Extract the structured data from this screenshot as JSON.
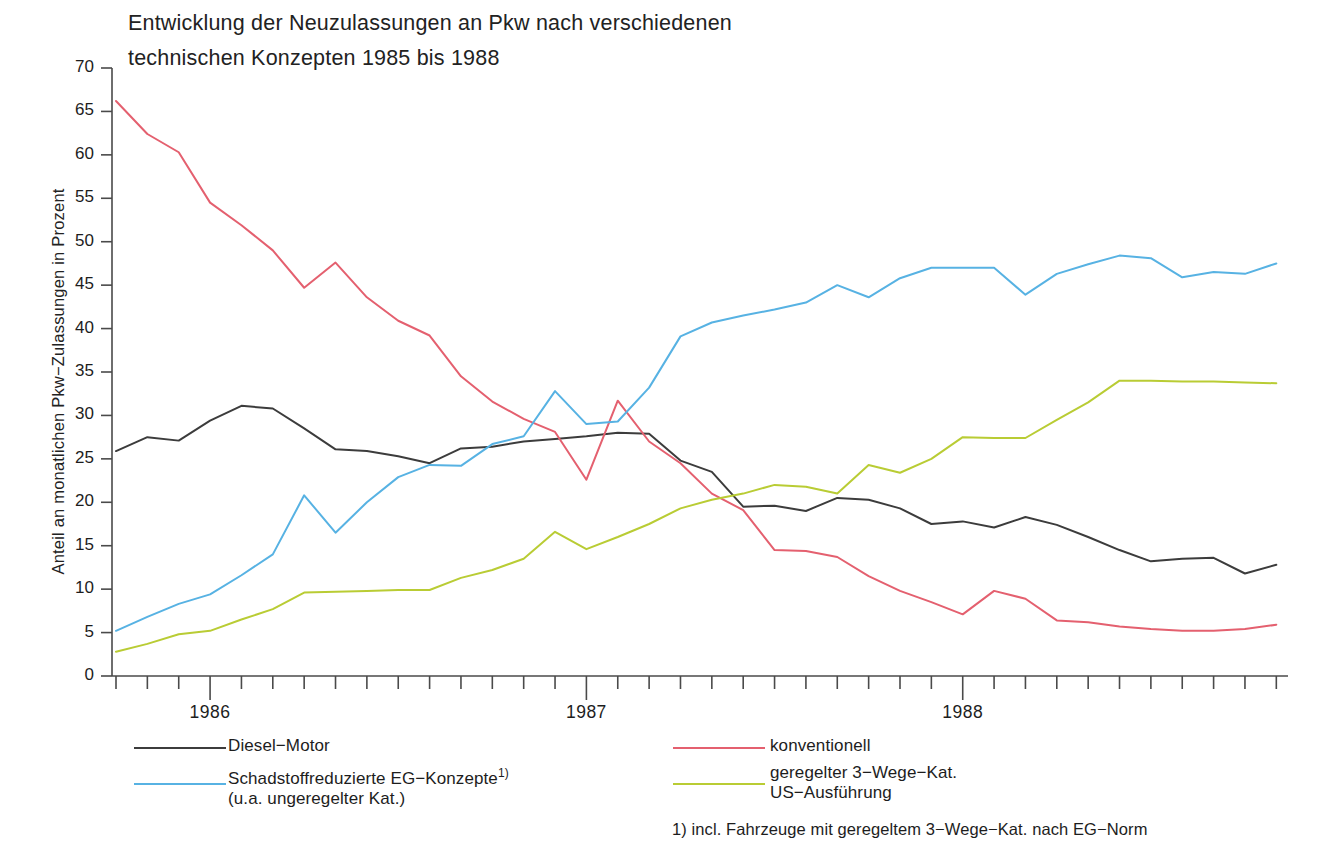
{
  "chart_data": {
    "type": "line",
    "title": "Entwicklung der Neuzulassungen an Pkw nach verschiedenen\ntechnischen Konzepten 1985 bis 1988",
    "xlabel": "",
    "ylabel": "Anteil an monatlichen Pkw−Zulassungen in Prozent",
    "ylim": [
      0,
      70
    ],
    "ytick_step": 5,
    "yticks": [
      "0",
      "5",
      "10",
      "15",
      "20",
      "25",
      "30",
      "35",
      "40",
      "45",
      "50",
      "55",
      "60",
      "65",
      "70"
    ],
    "xticks_major": [
      "1986",
      "1987",
      "1988"
    ],
    "x_start_month": "1985-10",
    "x_end_month": "1988-11",
    "x_minor_ticks": "monthly",
    "grid": false,
    "legend_position": "below-plot",
    "footnote": "1) incl. Fahrzeuge mit geregeltem 3−Wege−Kat. nach EG−Norm",
    "x": [
      "1985-10",
      "1985-11",
      "1985-12",
      "1986-01",
      "1986-02",
      "1986-03",
      "1986-04",
      "1986-05",
      "1986-06",
      "1986-07",
      "1986-08",
      "1986-09",
      "1986-10",
      "1986-11",
      "1986-12",
      "1987-01",
      "1987-02",
      "1987-03",
      "1987-04",
      "1987-05",
      "1987-06",
      "1987-07",
      "1987-08",
      "1987-09",
      "1987-10",
      "1987-11",
      "1987-12",
      "1988-01",
      "1988-02",
      "1988-03",
      "1988-04",
      "1988-05",
      "1988-06",
      "1988-07",
      "1988-08",
      "1988-09",
      "1988-10",
      "1988-11"
    ],
    "series": [
      {
        "name": "Diesel−Motor",
        "color": "#3c3c3c",
        "values": [
          25.9,
          27.5,
          27.1,
          29.4,
          31.1,
          30.8,
          28.5,
          26.1,
          25.9,
          25.3,
          24.5,
          26.2,
          26.4,
          27.0,
          27.3,
          27.6,
          28.0,
          27.9,
          24.8,
          23.5,
          19.5,
          19.6,
          19.0,
          20.5,
          20.3,
          19.3,
          17.5,
          17.8,
          17.1,
          18.3,
          17.4,
          16.0,
          14.5,
          13.2,
          13.5,
          13.6,
          11.8,
          12.8
        ]
      },
      {
        "name": "konventionell",
        "color": "#e4606f",
        "values": [
          66.2,
          62.4,
          60.3,
          54.5,
          51.9,
          49.0,
          44.7,
          47.6,
          43.6,
          40.9,
          39.2,
          34.5,
          31.6,
          29.6,
          28.1,
          22.6,
          31.7,
          27.0,
          24.5,
          21.0,
          19.1,
          14.5,
          14.4,
          13.7,
          11.5,
          9.8,
          8.5,
          7.1,
          9.8,
          8.9,
          6.4,
          6.2,
          5.7,
          5.4,
          5.2,
          5.2,
          5.4,
          5.9
        ]
      },
      {
        "name": "Schadstoffreduzierte EG−Konzepte 1)\n(u.a. ungeregelter Kat.)",
        "color": "#57b2e3",
        "values": [
          5.2,
          6.8,
          8.3,
          9.4,
          11.6,
          14.0,
          20.8,
          16.5,
          20.0,
          22.9,
          24.3,
          24.2,
          26.7,
          27.6,
          32.8,
          29.0,
          29.3,
          33.2,
          39.1,
          40.7,
          41.5,
          42.2,
          43.0,
          45.0,
          43.6,
          45.8,
          47.0,
          47.0,
          47.0,
          43.9,
          46.3,
          47.4,
          48.4,
          48.1,
          45.9,
          46.5,
          46.3,
          47.5
        ]
      },
      {
        "name": "geregelter 3−Wege−Kat.\nUS−Ausführung",
        "color": "#b9cc34",
        "values": [
          2.8,
          3.7,
          4.8,
          5.2,
          6.5,
          7.7,
          9.6,
          9.7,
          9.8,
          9.9,
          9.9,
          11.3,
          12.2,
          13.5,
          16.6,
          14.6,
          16.0,
          17.5,
          19.3,
          20.3,
          21.0,
          22.0,
          21.8,
          21.0,
          24.3,
          23.4,
          25.0,
          27.5,
          27.4,
          27.4,
          29.5,
          31.5,
          34.0,
          34.0,
          33.9,
          33.9,
          33.8,
          33.7
        ]
      }
    ]
  },
  "legend": {
    "entries": [
      {
        "label": "Diesel−Motor",
        "color": "#3c3c3c"
      },
      {
        "label": "Schadstoffreduzierte EG−Konzepte",
        "label2": "(u.a. ungeregelter Kat.)",
        "marker": "1)",
        "color": "#57b2e3"
      },
      {
        "label": "konventionell",
        "color": "#e4606f"
      },
      {
        "label": "geregelter 3−Wege−Kat.",
        "label2": "US−Ausführung",
        "color": "#b9cc34"
      }
    ]
  }
}
